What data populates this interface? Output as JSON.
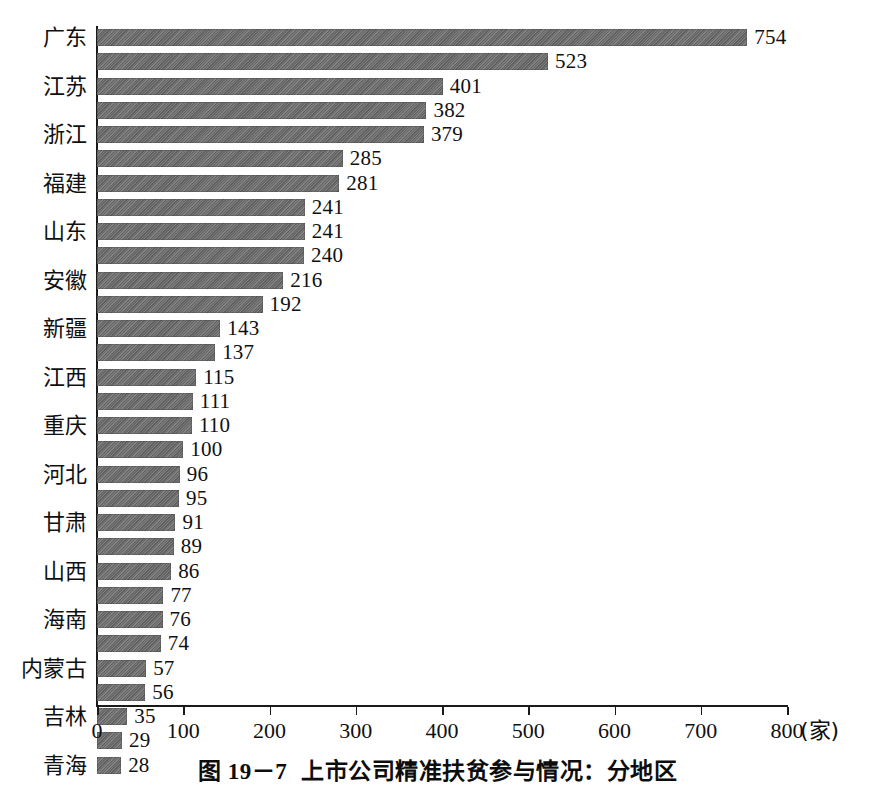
{
  "caption": {
    "figure_number": "图 19－7",
    "title": "上市公司精准扶贫参与情况：分地区"
  },
  "axis": {
    "x_unit": "(家)",
    "x_ticks": [
      "0",
      "100",
      "200",
      "300",
      "400",
      "500",
      "600",
      "700",
      "800"
    ]
  },
  "chart_data": {
    "type": "bar",
    "orientation": "horizontal",
    "title": "上市公司精准扶贫参与情况：分地区",
    "xlabel": "(家)",
    "ylabel": "",
    "xlim": [
      0,
      800
    ],
    "grid": false,
    "legend": "none",
    "categories": [
      "广东",
      "",
      "江苏",
      "",
      "浙江",
      "",
      "福建",
      "",
      "山东",
      "",
      "安徽",
      "",
      "新疆",
      "",
      "江西",
      "",
      "重庆",
      "",
      "河北",
      "",
      "甘肃",
      "",
      "山西",
      "",
      "海南",
      "",
      "内蒙古",
      "",
      "吉林",
      "",
      "青海"
    ],
    "values": [
      754,
      523,
      401,
      382,
      379,
      285,
      281,
      241,
      241,
      240,
      216,
      192,
      143,
      137,
      115,
      111,
      110,
      100,
      96,
      95,
      91,
      89,
      86,
      77,
      76,
      74,
      57,
      56,
      35,
      29,
      28
    ],
    "bars": [
      {
        "value": 754,
        "label": "754",
        "category": "广东"
      },
      {
        "value": 523,
        "label": "523",
        "category": ""
      },
      {
        "value": 401,
        "label": "401",
        "category": "江苏"
      },
      {
        "value": 382,
        "label": "382",
        "category": ""
      },
      {
        "value": 379,
        "label": "379",
        "category": "浙江"
      },
      {
        "value": 285,
        "label": "285",
        "category": ""
      },
      {
        "value": 281,
        "label": "281",
        "category": "福建"
      },
      {
        "value": 241,
        "label": "241",
        "category": ""
      },
      {
        "value": 241,
        "label": "241",
        "category": "山东"
      },
      {
        "value": 240,
        "label": "240",
        "category": ""
      },
      {
        "value": 216,
        "label": "216",
        "category": "安徽"
      },
      {
        "value": 192,
        "label": "192",
        "category": ""
      },
      {
        "value": 143,
        "label": "143",
        "category": "新疆"
      },
      {
        "value": 137,
        "label": "137",
        "category": ""
      },
      {
        "value": 115,
        "label": "115",
        "category": "江西"
      },
      {
        "value": 111,
        "label": "111",
        "category": ""
      },
      {
        "value": 110,
        "label": "110",
        "category": "重庆"
      },
      {
        "value": 100,
        "label": "100",
        "category": ""
      },
      {
        "value": 96,
        "label": "96",
        "category": "河北"
      },
      {
        "value": 95,
        "label": "95",
        "category": ""
      },
      {
        "value": 91,
        "label": "91",
        "category": "甘肃"
      },
      {
        "value": 89,
        "label": "89",
        "category": ""
      },
      {
        "value": 86,
        "label": "86",
        "category": "山西"
      },
      {
        "value": 77,
        "label": "77",
        "category": ""
      },
      {
        "value": 76,
        "label": "76",
        "category": "海南"
      },
      {
        "value": 74,
        "label": "74",
        "category": ""
      },
      {
        "value": 57,
        "label": "57",
        "category": "内蒙古"
      },
      {
        "value": 56,
        "label": "56",
        "category": ""
      },
      {
        "value": 35,
        "label": "35",
        "category": "吉林"
      },
      {
        "value": 29,
        "label": "29",
        "category": ""
      },
      {
        "value": 28,
        "label": "28",
        "category": "青海"
      }
    ],
    "category_labels": [
      {
        "text": "广东",
        "bar_index": 0
      },
      {
        "text": "江苏",
        "bar_index": 2
      },
      {
        "text": "浙江",
        "bar_index": 4
      },
      {
        "text": "福建",
        "bar_index": 6
      },
      {
        "text": "山东",
        "bar_index": 8
      },
      {
        "text": "安徽",
        "bar_index": 10
      },
      {
        "text": "新疆",
        "bar_index": 12
      },
      {
        "text": "江西",
        "bar_index": 14
      },
      {
        "text": "重庆",
        "bar_index": 16
      },
      {
        "text": "河北",
        "bar_index": 18
      },
      {
        "text": "甘肃",
        "bar_index": 20
      },
      {
        "text": "山西",
        "bar_index": 22
      },
      {
        "text": "海南",
        "bar_index": 24
      },
      {
        "text": "内蒙古",
        "bar_index": 26
      },
      {
        "text": "吉林",
        "bar_index": 28
      },
      {
        "text": "青海",
        "bar_index": 30
      }
    ],
    "colors": {
      "bar_fill": "#6b6b6b",
      "axis": "#1a1a1a",
      "text": "#101010",
      "background": "#ffffff"
    }
  }
}
